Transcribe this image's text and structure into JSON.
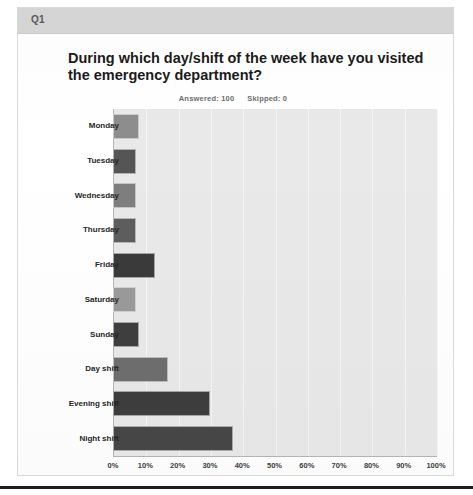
{
  "question": {
    "band_label": "Q1"
  },
  "chart_data": {
    "type": "bar",
    "orientation": "horizontal",
    "title": "During which day/shift of the week have you visited the emergency department?",
    "subtitle_answered": "Answered: 100",
    "subtitle_skipped": "Skipped: 0",
    "xlabel": "",
    "ylabel": "",
    "xlim": [
      0,
      100
    ],
    "grid": true,
    "legend": "none",
    "categories": [
      "Monday",
      "Tuesday",
      "Wednesday",
      "Thursday",
      "Friday",
      "Saturday",
      "Sunday",
      "Day shift",
      "Evening shift",
      "Night shift"
    ],
    "values": [
      8,
      7,
      7,
      7,
      13,
      7,
      8,
      17,
      30,
      37
    ],
    "value_unit": "%",
    "xticks": [
      "0%",
      "10%",
      "20%",
      "30%",
      "40%",
      "50%",
      "60%",
      "70%",
      "80%",
      "90%",
      "100%"
    ],
    "xtick_values": [
      0,
      10,
      20,
      30,
      40,
      50,
      60,
      70,
      80,
      90,
      100
    ],
    "bar_colors": [
      "#8d8d8d",
      "#555555",
      "#7e7e7e",
      "#5d5d5d",
      "#3a3a3a",
      "#9a9a9a",
      "#3f3f3f",
      "#6e6e6e",
      "#3d3d3d",
      "#474747"
    ],
    "plot_background": "#e9e9e9",
    "gridline_color": "#f6f6f6",
    "axis_color": "#b6b6b6"
  }
}
